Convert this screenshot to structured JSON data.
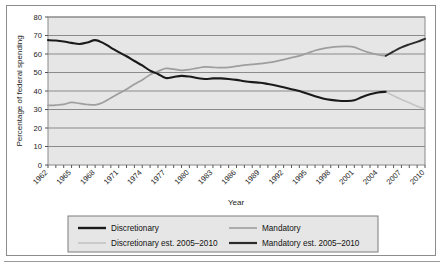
{
  "chart_data": {
    "type": "line",
    "title": "",
    "xlabel": "Year",
    "ylabel": "Percentage of federal spending",
    "xlim": [
      1962,
      2010
    ],
    "ylim": [
      0,
      80
    ],
    "ytick_step": 10,
    "yticks": [
      "0",
      "10",
      "20",
      "30",
      "40",
      "50",
      "60",
      "70",
      "80"
    ],
    "xticks": [
      "1962",
      "1965",
      "1968",
      "1971",
      "1974",
      "1977",
      "1980",
      "1983",
      "1986",
      "1989",
      "1992",
      "1995",
      "1998",
      "2001",
      "2004",
      "2007",
      "2010"
    ],
    "xtick_step": 3,
    "grid": "horizontal",
    "legend_position": "bottom",
    "plot_background": "#e6e6e6",
    "x": [
      1962,
      1963,
      1964,
      1965,
      1966,
      1967,
      1968,
      1969,
      1970,
      1971,
      1972,
      1973,
      1974,
      1975,
      1976,
      1977,
      1978,
      1979,
      1980,
      1981,
      1982,
      1983,
      1984,
      1985,
      1986,
      1987,
      1988,
      1989,
      1990,
      1991,
      1992,
      1993,
      1994,
      1995,
      1996,
      1997,
      1998,
      1999,
      2000,
      2001,
      2002,
      2003,
      2004,
      2005,
      2006,
      2007,
      2008,
      2009,
      2010
    ],
    "series": [
      {
        "name": "Discretionary",
        "color": "#1a1a1a",
        "width": 2.1,
        "x": [
          1962,
          1963,
          1964,
          1965,
          1966,
          1967,
          1968,
          1969,
          1970,
          1971,
          1972,
          1973,
          1974,
          1975,
          1976,
          1977,
          1978,
          1979,
          1980,
          1981,
          1982,
          1983,
          1984,
          1985,
          1986,
          1987,
          1988,
          1989,
          1990,
          1991,
          1992,
          1993,
          1994,
          1995,
          1996,
          1997,
          1998,
          1999,
          2000,
          2001,
          2002,
          2003,
          2004,
          2005
        ],
        "values": [
          67.5,
          67.3,
          66.8,
          66.0,
          65.4,
          66.2,
          67.5,
          66.0,
          63.5,
          61.0,
          58.8,
          56.2,
          53.8,
          51.0,
          49.2,
          47.0,
          47.6,
          48.2,
          47.8,
          47.0,
          46.5,
          46.8,
          46.8,
          46.5,
          46.0,
          45.3,
          44.8,
          44.5,
          43.8,
          43.0,
          42.0,
          41.0,
          40.0,
          38.6,
          37.2,
          36.0,
          35.2,
          34.7,
          34.6,
          35.0,
          36.8,
          38.2,
          39.2,
          39.6
        ]
      },
      {
        "name": "Mandatory",
        "color": "#9e9e9e",
        "width": 1.7,
        "x": [
          1962,
          1963,
          1964,
          1965,
          1966,
          1967,
          1968,
          1969,
          1970,
          1971,
          1972,
          1973,
          1974,
          1975,
          1976,
          1977,
          1978,
          1979,
          1980,
          1981,
          1982,
          1983,
          1984,
          1985,
          1986,
          1987,
          1988,
          1989,
          1990,
          1991,
          1992,
          1993,
          1994,
          1995,
          1996,
          1997,
          1998,
          1999,
          2000,
          2001,
          2002,
          2003,
          2004,
          2005
        ],
        "values": [
          32.2,
          32.4,
          32.8,
          33.8,
          33.3,
          32.7,
          32.5,
          33.8,
          36.2,
          38.6,
          41.0,
          43.6,
          46.0,
          48.8,
          50.6,
          52.2,
          51.8,
          51.2,
          51.6,
          52.4,
          53.0,
          52.8,
          52.6,
          52.8,
          53.4,
          54.0,
          54.4,
          54.8,
          55.3,
          56.0,
          57.0,
          58.0,
          59.0,
          60.4,
          61.9,
          62.9,
          63.6,
          64.0,
          64.1,
          63.7,
          62.0,
          60.6,
          59.6,
          59.0
        ]
      },
      {
        "name": "Discretionary est. 2005–2010",
        "color": "#c4c4c4",
        "width": 1.6,
        "x": [
          2005,
          2006,
          2007,
          2008,
          2009,
          2010
        ],
        "values": [
          39.6,
          37.4,
          35.4,
          33.6,
          31.8,
          30.4
        ]
      },
      {
        "name": "Mandatory est. 2005–2010",
        "color": "#2b2b2b",
        "width": 1.9,
        "x": [
          2005,
          2006,
          2007,
          2008,
          2009,
          2010
        ],
        "values": [
          59.0,
          61.4,
          63.6,
          65.2,
          66.6,
          68.2
        ]
      }
    ]
  },
  "legend": {
    "items": [
      {
        "label": "Discretionary",
        "color": "#1a1a1a",
        "width": 2.4
      },
      {
        "label": "Mandatory",
        "color": "#9e9e9e",
        "width": 1.6
      },
      {
        "label": "Discretionary est. 2005–2010",
        "color": "#c4c4c4",
        "width": 1.6
      },
      {
        "label": "Mandatory est. 2005–2010",
        "color": "#2b2b2b",
        "width": 2.2
      }
    ]
  }
}
